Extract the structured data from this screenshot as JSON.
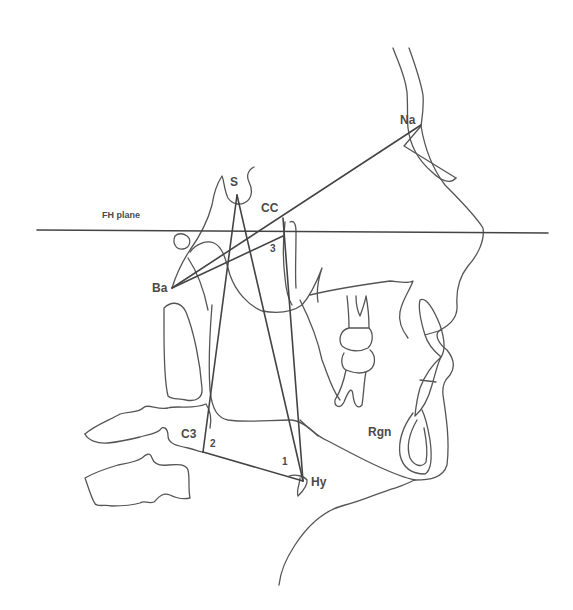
{
  "figure": {
    "type": "cephalometric tracing",
    "background": "#ffffff",
    "line_color": "#444444"
  },
  "labels": {
    "fh_plane": "FH plane",
    "na": "Na",
    "s": "S",
    "cc": "CC",
    "ba": "Ba",
    "c3": "C3",
    "hy": "Hy",
    "rgn": "Rgn"
  },
  "angle_numbers": {
    "one": "1",
    "two": "2",
    "three": "3"
  },
  "landmarks": [
    {
      "name": "Na",
      "x": 421,
      "y": 125
    },
    {
      "name": "S",
      "x": 237,
      "y": 195
    },
    {
      "name": "CC",
      "x": 283,
      "y": 218
    },
    {
      "name": "Ba",
      "x": 172,
      "y": 288
    },
    {
      "name": "C3",
      "x": 203,
      "y": 452
    },
    {
      "name": "Hy",
      "x": 303,
      "y": 481
    },
    {
      "name": "Rgn",
      "x": 395,
      "y": 433
    }
  ],
  "reference_lines": [
    {
      "name": "FH plane",
      "from": [
        37,
        230
      ],
      "to": [
        548,
        233
      ]
    },
    {
      "name": "Ba-Na",
      "from": [
        172,
        288
      ],
      "to": [
        421,
        125
      ]
    },
    {
      "name": "S-C3",
      "from": [
        237,
        195
      ],
      "to": [
        203,
        452
      ]
    },
    {
      "name": "S-Hy",
      "from": [
        237,
        195
      ],
      "to": [
        303,
        481
      ]
    },
    {
      "name": "C3-Hy",
      "from": [
        203,
        452
      ],
      "to": [
        303,
        481
      ]
    },
    {
      "name": "CC-Hy",
      "from": [
        283,
        218
      ],
      "to": [
        303,
        481
      ]
    }
  ]
}
